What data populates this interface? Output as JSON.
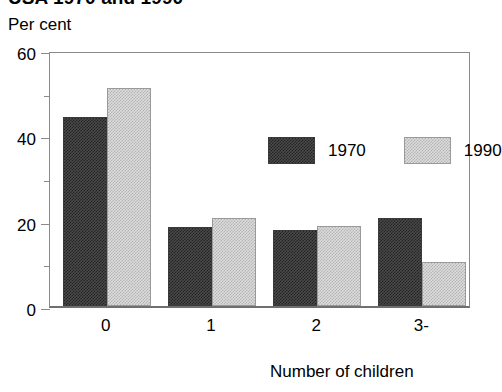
{
  "chart_data": {
    "type": "bar",
    "title": "USA 1970 and 1990",
    "subtitle": "",
    "ylabel": "Per cent",
    "xlabel": "Number of children",
    "categories": [
      "0",
      "1",
      "2",
      "3-"
    ],
    "series": [
      {
        "name": "1970",
        "color": "#4a4a4a",
        "values": [
          44.2,
          18.5,
          17.8,
          20.6
        ]
      },
      {
        "name": "1990",
        "color": "#dcdcdc",
        "values": [
          51.0,
          20.7,
          18.8,
          10.3
        ]
      }
    ],
    "ylim": [
      0,
      60
    ],
    "ytick_labels": [
      "0",
      "20",
      "40",
      "60"
    ],
    "ytick_values": [
      0,
      20,
      40,
      60
    ],
    "yminor_values": [
      10,
      30,
      50
    ],
    "grid": false,
    "legend_position": "inside-top-center"
  }
}
